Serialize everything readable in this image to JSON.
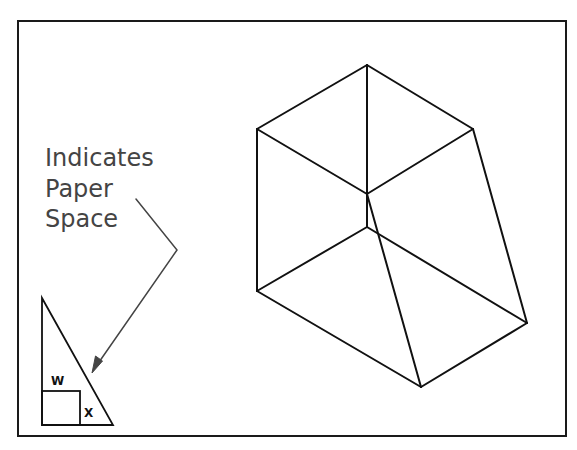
{
  "diagram": {
    "frame": {
      "x": 18,
      "y": 21,
      "width": 548,
      "height": 415
    },
    "annotation": {
      "lines": [
        "Indicates",
        "Paper",
        "Space"
      ],
      "color": "#444444"
    },
    "paper_space_icon": {
      "letter_w": "W",
      "letter_x": "X"
    },
    "wireframe": {
      "vertices": {
        "top": [
          367,
          65
        ],
        "left": [
          257,
          129
        ],
        "right": [
          473,
          129
        ],
        "center_upper": [
          367,
          194
        ],
        "center_lower": [
          367,
          227
        ],
        "lower_left": [
          257,
          291
        ],
        "right_bottom": [
          527,
          323
        ],
        "bottom": [
          421,
          387
        ]
      },
      "edges": [
        [
          "top",
          "left"
        ],
        [
          "top",
          "right"
        ],
        [
          "top",
          "center_upper"
        ],
        [
          "left",
          "center_upper"
        ],
        [
          "right",
          "center_upper"
        ],
        [
          "left",
          "lower_left"
        ],
        [
          "right",
          "right_bottom"
        ],
        [
          "center_upper",
          "center_lower"
        ],
        [
          "center_lower",
          "lower_left"
        ],
        [
          "center_lower",
          "right_bottom"
        ],
        [
          "center_upper",
          "bottom"
        ],
        [
          "lower_left",
          "bottom"
        ],
        [
          "bottom",
          "right_bottom"
        ]
      ]
    }
  }
}
